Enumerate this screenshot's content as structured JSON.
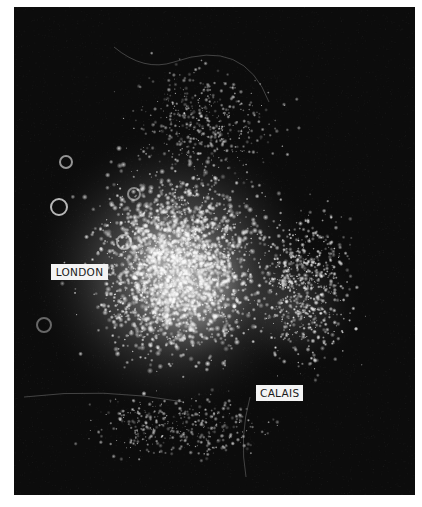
{
  "image": {
    "description": "Satellite night-time photograph showing city lights of south-east England and northern France",
    "background_color": "#0c0c0c",
    "light_color": "#ffffff"
  },
  "labels": {
    "london": "LONDON",
    "calais": "CALAIS"
  }
}
